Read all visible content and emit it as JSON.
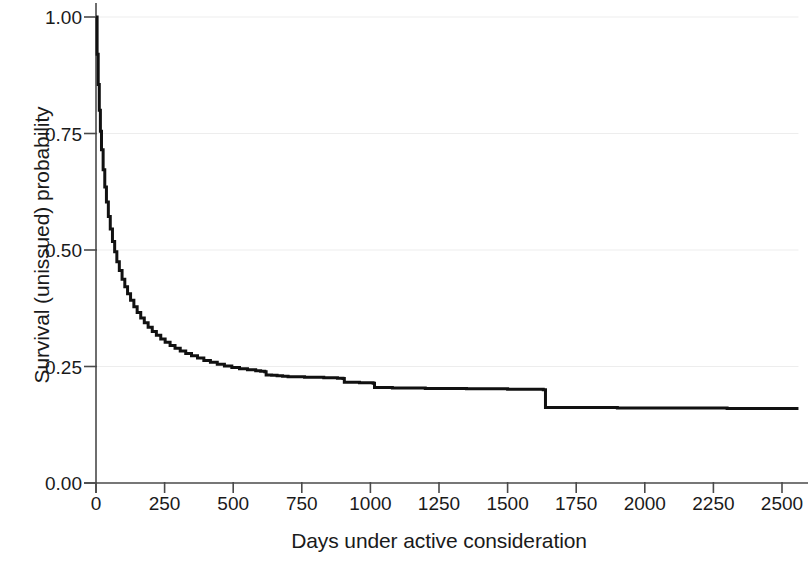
{
  "chart_data": {
    "type": "line",
    "subtype": "kaplan-meier-survival-step",
    "title": "",
    "subtitle": "",
    "xlabel": "Days under active consideration",
    "ylabel": "Survival (unissued) probability",
    "xlim": [
      0,
      2560
    ],
    "ylim": [
      0.0,
      1.0
    ],
    "xticks": [
      0,
      250,
      500,
      750,
      1000,
      1250,
      1500,
      1750,
      2000,
      2250,
      2500
    ],
    "xtick_labels": [
      "0",
      "250",
      "500",
      "750",
      "1000",
      "1250",
      "1500",
      "1750",
      "2000",
      "2250",
      "2500"
    ],
    "yticks": [
      0.0,
      0.25,
      0.5,
      0.75,
      1.0
    ],
    "ytick_labels": [
      "0.00",
      "0.25",
      "0.50",
      "0.75",
      "1.00"
    ],
    "grid": {
      "horizontal": true,
      "vertical": false,
      "color": "#ededed"
    },
    "legend": null,
    "line_color": "#111111",
    "line_width": 3.0,
    "axis_color": "#4a4a4a",
    "background": "#ffffff",
    "series": [
      {
        "name": "Survival (unissued) probability",
        "step": "post",
        "x": [
          0,
          4,
          8,
          12,
          16,
          20,
          26,
          32,
          38,
          45,
          52,
          60,
          68,
          76,
          85,
          95,
          105,
          115,
          126,
          138,
          150,
          163,
          176,
          190,
          205,
          220,
          236,
          252,
          270,
          288,
          307,
          327,
          348,
          370,
          393,
          417,
          442,
          468,
          495,
          523,
          552,
          582,
          600,
          615,
          620,
          640,
          660,
          680,
          700,
          760,
          830,
          880,
          900,
          905,
          960,
          1010,
          1015,
          1080,
          1200,
          1350,
          1500,
          1630,
          1638,
          1700,
          1900,
          2100,
          2300,
          2500,
          2560
        ],
        "y": [
          1.0,
          0.92,
          0.855,
          0.8,
          0.755,
          0.715,
          0.672,
          0.635,
          0.603,
          0.572,
          0.545,
          0.518,
          0.496,
          0.475,
          0.456,
          0.437,
          0.421,
          0.406,
          0.392,
          0.378,
          0.366,
          0.354,
          0.344,
          0.334,
          0.325,
          0.317,
          0.309,
          0.302,
          0.295,
          0.289,
          0.283,
          0.278,
          0.273,
          0.268,
          0.263,
          0.259,
          0.255,
          0.251,
          0.248,
          0.245,
          0.243,
          0.241,
          0.24,
          0.239,
          0.232,
          0.231,
          0.23,
          0.229,
          0.228,
          0.227,
          0.226,
          0.225,
          0.224,
          0.216,
          0.215,
          0.214,
          0.205,
          0.204,
          0.203,
          0.202,
          0.201,
          0.2,
          0.162,
          0.162,
          0.161,
          0.161,
          0.16,
          0.16,
          0.16
        ]
      }
    ],
    "annotations": [
      {
        "text": "Steep early decline from 1.00 to about 0.25 within the first 250 days",
        "type": "description"
      },
      {
        "text": "Large step drop from about 0.20 to about 0.16 at roughly 1636 days",
        "type": "description"
      },
      {
        "text": "Flat plateau at about 0.16 from roughly 1640 to 2560 days",
        "type": "description"
      }
    ]
  },
  "axes": {
    "y_title": "Survival (unissued) probability",
    "x_title": "Days under active consideration",
    "y_tick_labels": [
      "1.00",
      "0.75",
      "0.50",
      "0.25",
      "0.00"
    ],
    "x_tick_labels": [
      "0",
      "250",
      "500",
      "750",
      "1000",
      "1250",
      "1500",
      "1750",
      "2000",
      "2250",
      "2500"
    ]
  }
}
